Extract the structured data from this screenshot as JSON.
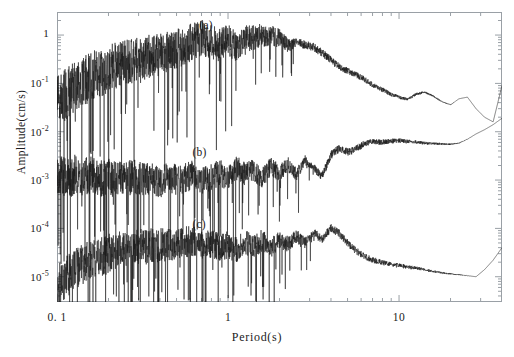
{
  "chart_data": {
    "type": "line",
    "title": "",
    "xlabel": "Period(s)",
    "ylabel": "Amplitude(cm/s)",
    "xscale": "log",
    "yscale": "log",
    "xlim": [
      0.1,
      40
    ],
    "ylim": [
      3e-06,
      3.0
    ],
    "grid": false,
    "legend_position": "inline-annotations",
    "xtick_labels": [
      "0.1",
      "1",
      "10"
    ],
    "xtick_values": [
      0.1,
      1,
      10
    ],
    "ytick_labels": [
      "1",
      "10-1",
      "10-2",
      "10-3",
      "10-4",
      "10-5"
    ],
    "ytick_values": [
      1,
      0.1,
      0.01,
      0.001,
      0.0001,
      1e-05
    ],
    "annotations": [
      {
        "text": "(a)",
        "x": 0.68,
        "y": 1.5
      },
      {
        "text": "(b)",
        "x": 0.62,
        "y": 0.0035
      },
      {
        "text": "(c)",
        "x": 0.62,
        "y": 0.00011
      }
    ],
    "series": [
      {
        "name": "(a)",
        "description": "Fourier amplitude spectrum, upper trace: noisy rise from ~3e-2 at 0.1 s to plateau near 1 cm/s between 0.6 and 3 s, then smooth decay to ~2e-2 near 30 s",
        "x": [
          0.1,
          0.11,
          0.12,
          0.13,
          0.14,
          0.16,
          0.18,
          0.2,
          0.22,
          0.25,
          0.28,
          0.32,
          0.36,
          0.4,
          0.45,
          0.5,
          0.56,
          0.63,
          0.71,
          0.8,
          0.9,
          1.0,
          1.12,
          1.26,
          1.41,
          1.58,
          1.78,
          2.0,
          2.24,
          2.51,
          2.82,
          3.16,
          3.55,
          4.0,
          4.47,
          5.01,
          5.62,
          6.31,
          7.08,
          7.94,
          8.91,
          10.0,
          11.2,
          12.6,
          14.1,
          15.8,
          17.8,
          20.0,
          22.4,
          25.1,
          28.2,
          31.6,
          35.5,
          40.0
        ],
        "y": [
          0.04,
          0.055,
          0.075,
          0.09,
          0.11,
          0.14,
          0.17,
          0.2,
          0.23,
          0.27,
          0.3,
          0.33,
          0.38,
          0.42,
          0.46,
          0.52,
          0.6,
          0.76,
          0.88,
          0.7,
          0.62,
          0.8,
          0.56,
          0.82,
          0.9,
          1.0,
          0.95,
          0.88,
          0.62,
          0.7,
          0.64,
          0.56,
          0.43,
          0.3,
          0.22,
          0.18,
          0.15,
          0.12,
          0.09,
          0.075,
          0.06,
          0.052,
          0.046,
          0.06,
          0.066,
          0.055,
          0.042,
          0.036,
          0.048,
          0.052,
          0.03,
          0.02,
          0.016,
          0.09
        ]
      },
      {
        "name": "(b)",
        "description": "Middle trace: noisy band around 1e-3 cm/s from 0.1 to 3 s, rising after 4 s toward 1e-2 at long periods",
        "x": [
          0.1,
          0.11,
          0.12,
          0.13,
          0.14,
          0.16,
          0.18,
          0.2,
          0.22,
          0.25,
          0.28,
          0.32,
          0.36,
          0.4,
          0.45,
          0.5,
          0.56,
          0.63,
          0.71,
          0.8,
          0.9,
          1.0,
          1.12,
          1.26,
          1.41,
          1.58,
          1.78,
          2.0,
          2.24,
          2.51,
          2.82,
          3.16,
          3.55,
          4.0,
          4.47,
          5.01,
          5.62,
          6.31,
          7.08,
          7.94,
          8.91,
          10.0,
          11.2,
          12.6,
          14.1,
          15.8,
          17.8,
          20.0,
          22.4,
          25.1,
          28.2,
          31.6,
          35.5,
          40.0
        ],
        "y": [
          0.0012,
          0.0013,
          0.0011,
          0.0014,
          0.0012,
          0.0013,
          0.0011,
          0.0012,
          0.001,
          0.0011,
          0.0012,
          0.001,
          0.0011,
          0.0009,
          0.0012,
          0.001,
          0.0011,
          0.0013,
          0.001,
          0.0012,
          0.0014,
          0.0011,
          0.0018,
          0.0013,
          0.0016,
          0.0011,
          0.0019,
          0.0014,
          0.0021,
          0.0013,
          0.0026,
          0.0018,
          0.0012,
          0.0033,
          0.0045,
          0.0038,
          0.0044,
          0.0058,
          0.0062,
          0.006,
          0.0064,
          0.0066,
          0.0063,
          0.0061,
          0.0058,
          0.0057,
          0.0056,
          0.0055,
          0.0058,
          0.007,
          0.009,
          0.011,
          0.014,
          0.019
        ]
      },
      {
        "name": "(c)",
        "description": "Lower trace: noisy band rising from ~6e-6 at 0.1 s to ~6e-5 near 1 s, peaking ~1e-4 near 4 s then decaying to ~1e-5 at 30 s and rising at the right edge",
        "x": [
          0.1,
          0.11,
          0.12,
          0.13,
          0.14,
          0.16,
          0.18,
          0.2,
          0.22,
          0.25,
          0.28,
          0.32,
          0.36,
          0.4,
          0.45,
          0.5,
          0.56,
          0.63,
          0.71,
          0.8,
          0.9,
          1.0,
          1.12,
          1.26,
          1.41,
          1.58,
          1.78,
          2.0,
          2.24,
          2.51,
          2.82,
          3.16,
          3.55,
          4.0,
          4.47,
          5.01,
          5.62,
          6.31,
          7.08,
          7.94,
          8.91,
          10.0,
          11.2,
          12.6,
          14.1,
          15.8,
          17.8,
          20.0,
          22.4,
          25.1,
          28.2,
          31.6,
          35.5,
          40.0
        ],
        "y": [
          7e-06,
          9e-06,
          1.2e-05,
          1.5e-05,
          1.8e-05,
          2.2e-05,
          2.6e-05,
          3e-05,
          3.3e-05,
          3.6e-05,
          4e-05,
          4.2e-05,
          4.4e-05,
          4.6e-05,
          4.8e-05,
          5e-05,
          5.2e-05,
          5.4e-05,
          4.4e-05,
          5e-05,
          4e-05,
          4.6e-05,
          3.6e-05,
          5.2e-05,
          4.2e-05,
          5.6e-05,
          4e-05,
          6.2e-05,
          4.6e-05,
          7e-05,
          5e-05,
          8e-05,
          6e-05,
          0.0001,
          7.8e-05,
          5e-05,
          3.4e-05,
          2.6e-05,
          2.2e-05,
          2e-05,
          1.8e-05,
          1.7e-05,
          1.6e-05,
          1.5e-05,
          1.4e-05,
          1.3e-05,
          1.2e-05,
          1.15e-05,
          1.1e-05,
          1.05e-05,
          1e-05,
          1.4e-05,
          2.2e-05,
          4e-05
        ]
      }
    ]
  },
  "axes": {
    "y_title": "Amplitude(cm/s)",
    "x_title": "Period(s)",
    "y_ticks": [
      {
        "label": "1",
        "exp": null,
        "value": 1
      },
      {
        "label": "10",
        "exp": "-1",
        "value": 0.1
      },
      {
        "label": "10",
        "exp": "-2",
        "value": 0.01
      },
      {
        "label": "10",
        "exp": "-3",
        "value": 0.001
      },
      {
        "label": "10",
        "exp": "-4",
        "value": 0.0001
      },
      {
        "label": "10",
        "exp": "-5",
        "value": 1e-05
      }
    ],
    "x_ticks": [
      {
        "label": "0. 1",
        "value": 0.1
      },
      {
        "label": "1",
        "value": 1
      },
      {
        "label": "10",
        "value": 10
      }
    ]
  },
  "labels": {
    "a": "(a)",
    "b": "(b)",
    "c": "(c)"
  },
  "colors": {
    "trace": "#1a1a1a",
    "frame": "#9aa0a6",
    "background": "#ffffff"
  }
}
